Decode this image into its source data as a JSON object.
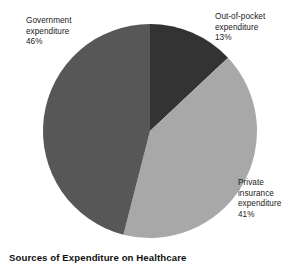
{
  "chart_data": {
    "type": "pie",
    "title": "Sources of Expenditure on Healthcare",
    "xlabel": "",
    "ylabel": "",
    "legend_position": "none",
    "grid": false,
    "categories": [
      "Government expenditure",
      "Out-of-pocket expenditure",
      "Private insurance expenditure"
    ],
    "values": [
      46,
      13,
      41
    ],
    "value_unit": "%",
    "slices": [
      {
        "label": "Government expenditure",
        "label_line1": "Government",
        "label_line2": "expenditure",
        "value": 46,
        "value_text": "46%",
        "color": "#575757",
        "start_angle_deg": 156.6,
        "end_angle_deg": 322.2
      },
      {
        "label": "Out-of-pocket expenditure",
        "label_line1": "Out-of-pocket",
        "label_line2": "expenditure",
        "value": 13,
        "value_text": "13%",
        "color": "#333333",
        "start_angle_deg": 0,
        "end_angle_deg": 46.8
      },
      {
        "label": "Private insurance expenditure",
        "label_line1": "Private",
        "label_line2": "insurance",
        "label_line3": "expenditure",
        "value": 41,
        "value_text": "41%",
        "color": "#a8a8a8",
        "start_angle_deg": 46.8,
        "end_angle_deg": 194.4
      }
    ],
    "background_color": "#ffffff",
    "title_color": "#111111",
    "label_color": "#1a1a1a"
  }
}
